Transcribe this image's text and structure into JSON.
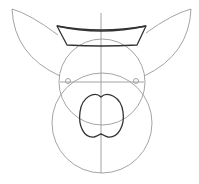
{
  "drawing": {
    "title": "Pig face sketch construction",
    "colors": {
      "guide_stroke": "#9a9a9a",
      "ink_stroke": "#333333",
      "background": "#ffffff"
    },
    "shapes": {
      "upper_head_circle": {
        "cx": 102,
        "cy": 82,
        "r": 43
      },
      "lower_head_circle": {
        "cx": 102,
        "cy": 123,
        "r": 50
      },
      "center_line": {
        "x": 101,
        "y1": 13,
        "y2": 173
      },
      "eye_line": {
        "x1": 60,
        "x2": 144,
        "y": 82
      },
      "left_eye": {
        "cx": 68,
        "cy": 81,
        "r": 2.5
      },
      "right_eye": {
        "cx": 136,
        "cy": 81,
        "r": 2.5
      },
      "left_ear": {
        "tip": [
          12,
          9
        ],
        "base_outer": [
          60,
          76
        ],
        "base_inner": [
          58,
          35
        ]
      },
      "right_ear": {
        "tip": [
          191,
          9
        ],
        "base_outer": [
          144,
          76
        ],
        "base_inner": [
          146,
          33
        ]
      },
      "hat": {
        "top_left": [
          57,
          26
        ],
        "top_right": [
          146,
          26
        ],
        "bottom_left": [
          67,
          45
        ],
        "bottom_right": [
          137,
          45
        ]
      },
      "nose": {
        "top": [
          101,
          97
        ],
        "bottom_notch": [
          101,
          136
        ],
        "left_x": 80,
        "right_x": 125
      }
    }
  }
}
